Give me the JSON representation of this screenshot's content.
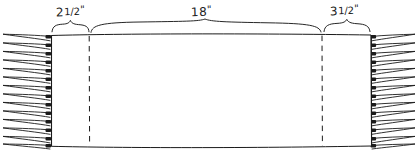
{
  "diagram": {
    "ink_color": "#1b1b1b",
    "background_color": "#ffffff",
    "dimensions": [
      {
        "id": "left-border",
        "name": "left-border-dimension",
        "value": "2",
        "fraction": "1/2",
        "unit": "\"",
        "full_text": "2 1/2\"",
        "brace_start_x": 52,
        "brace_end_x": 89,
        "label_x": 56,
        "label_y": 4
      },
      {
        "id": "center-field",
        "name": "center-field-dimension",
        "value": "18",
        "fraction": "",
        "unit": "\"",
        "full_text": "18\"",
        "brace_start_x": 91,
        "brace_end_x": 321,
        "label_x": 191,
        "label_y": 4
      },
      {
        "id": "right-border",
        "name": "right-border-dimension",
        "value": "3",
        "fraction": "1/2",
        "unit": "\"",
        "full_text": "3 1/2\"",
        "brace_start_x": 324,
        "brace_end_x": 370,
        "label_x": 330,
        "label_y": 3
      }
    ],
    "body": {
      "name": "woven-panel-body",
      "left_selvage_x": 51,
      "right_selvage_x": 371,
      "top_y": 34,
      "bottom_y": 147,
      "fill": "#ffffff"
    },
    "section_lines": [
      {
        "name": "left-section-dashed-line",
        "x": 89,
        "top_y": 36,
        "bottom_y": 146
      },
      {
        "name": "right-section-dashed-line",
        "x": 322,
        "top_y": 36,
        "bottom_y": 146
      }
    ],
    "fringe": {
      "name": "knotted-fringe",
      "strand_count": 13,
      "left_outer_x": 2,
      "left_inner_x": 51,
      "right_inner_x": 371,
      "right_outer_x": 415,
      "first_knot_y": 36,
      "last_knot_y": 145
    }
  }
}
